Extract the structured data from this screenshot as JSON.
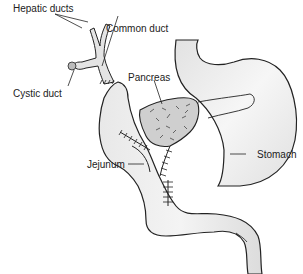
{
  "diagram": {
    "labels": {
      "hepatic_ducts": "Hepatic ducts",
      "common_duct": "Common duct",
      "cystic_duct": "Cystic duct",
      "pancreas": "Pancreas",
      "jejunum": "Jejunum",
      "stomach": "Stomach"
    },
    "colors": {
      "organ_fill": "#e6e6e6",
      "pancreas_fill": "#c8c8c8",
      "outline": "#222222",
      "background": "#ffffff"
    }
  }
}
